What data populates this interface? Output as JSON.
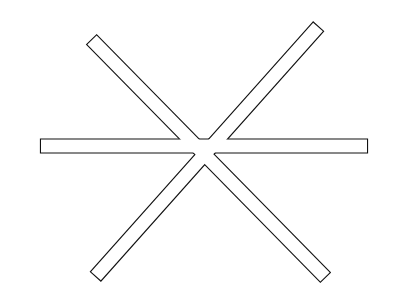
{
  "figure": {
    "stroke_color": "#111111",
    "fill_color": "#ffffff",
    "background": "#ffffff",
    "bar_half_width": 6.5,
    "bars": [
      {
        "name": "horizontal-bar",
        "x1": 41,
        "y1": 146,
        "x2": 367,
        "y2": 146
      },
      {
        "name": "diagonal-bar-tl-br",
        "x1": 92,
        "y1": 40,
        "x2": 325,
        "y2": 277
      },
      {
        "name": "diagonal-bar-tr-bl",
        "x1": 318,
        "y1": 27,
        "x2": 96,
        "y2": 276
      }
    ]
  }
}
